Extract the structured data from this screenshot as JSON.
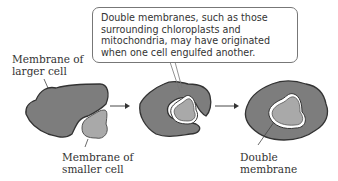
{
  "callout": {
    "lines": "Double membranes, such as those\nsurrounding chloroplasts and\nmitochondria, may have originated\nwhen one cell engulfed another."
  },
  "labels": {
    "larger_cell": "Membrane of\nlarger cell",
    "smaller_cell": "Membrane of\nsmaller cell",
    "double_membrane": "Double\nmembrane"
  },
  "colors": {
    "large_cell_fill": "#7d7d7d",
    "small_cell_fill": "#a9a9a9",
    "outline": "#333333",
    "gap": "#ffffff"
  },
  "steps": [
    {
      "name": "separate-cells"
    },
    {
      "name": "engulfing"
    },
    {
      "name": "engulfed-with-double-membrane"
    }
  ]
}
